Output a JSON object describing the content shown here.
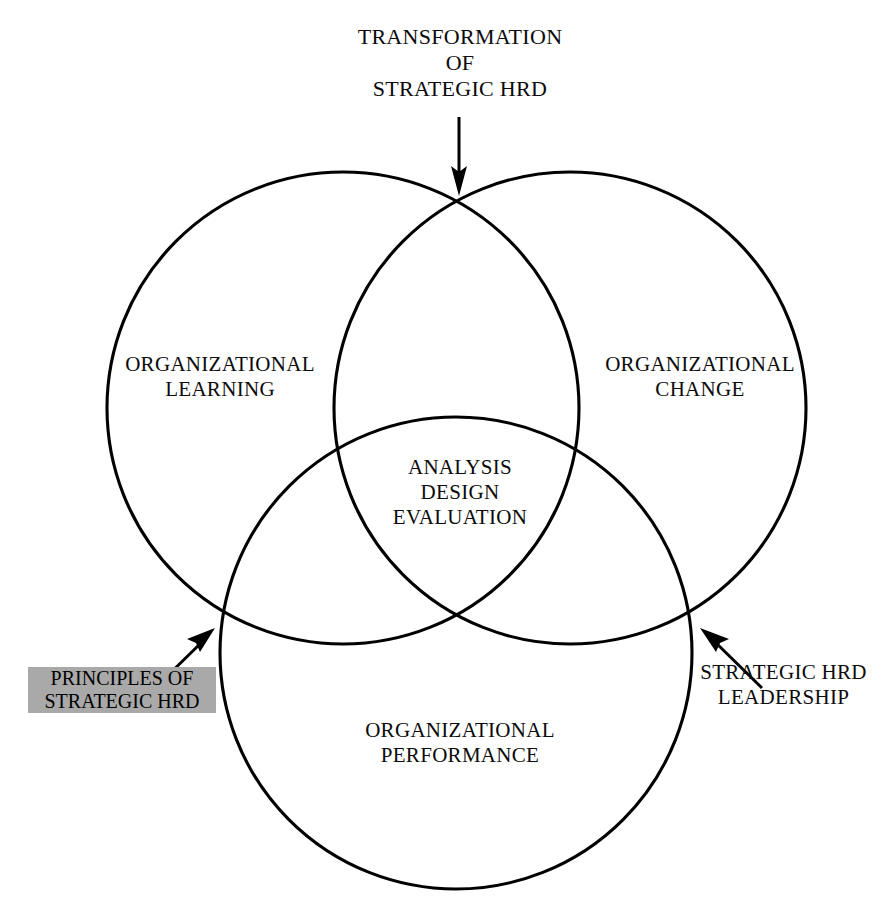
{
  "diagram": {
    "title": "TRANSFORMATION OF STRATEGIC HRD",
    "type": "venn-3-circle",
    "background_color": "#ffffff",
    "stroke_color": "#000000",
    "highlight_box_color": "#a9a9a9"
  },
  "caption": {
    "top": "TRANSFORMATION\nOF\nSTRATEGIC HRD"
  },
  "circles": {
    "left": {
      "label": "ORGANIZATIONAL\nLEARNING",
      "cx": 343,
      "cy": 408,
      "r": 236
    },
    "right": {
      "label": "ORGANIZATIONAL\nCHANGE",
      "cx": 570,
      "cy": 408,
      "r": 236
    },
    "bottom": {
      "label": "ORGANIZATIONAL\nPERFORMANCE",
      "cx": 456,
      "cy": 653,
      "r": 236
    }
  },
  "intersection": {
    "center_label": "ANALYSIS\nDESIGN\nEVALUATION"
  },
  "annotations": {
    "left_box": {
      "label": "PRINCIPLES OF\nSTRATEGIC HRD",
      "highlighted": true
    },
    "right_label": {
      "label": "STRATEGIC HRD\nLEADERSHIP",
      "highlighted": false
    }
  },
  "arrows": [
    {
      "name": "arrow-top-down",
      "points_to": "top-intersection"
    },
    {
      "name": "arrow-left-up-right",
      "points_to": "left-intersection"
    },
    {
      "name": "arrow-right-up-left",
      "points_to": "right-intersection"
    }
  ]
}
